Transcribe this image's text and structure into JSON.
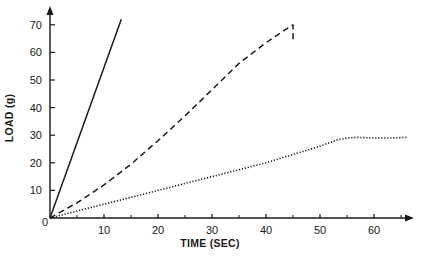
{
  "chart_data": {
    "type": "line",
    "title": "",
    "xlabel": "TIME (SEC)",
    "ylabel": "LOAD (g)",
    "xlim": [
      0,
      67
    ],
    "ylim": [
      0,
      73
    ],
    "x_ticks": [
      0,
      10,
      20,
      30,
      40,
      50,
      60
    ],
    "x_minor_ticks": [
      5,
      15,
      25,
      35,
      45,
      55,
      65
    ],
    "y_ticks": [
      0,
      10,
      20,
      30,
      40,
      50,
      60,
      70
    ],
    "grid": false,
    "legend": null,
    "series": [
      {
        "name": "solid",
        "style": "solid",
        "x": [
          0,
          13.2
        ],
        "y": [
          0,
          72
        ]
      },
      {
        "name": "dashed",
        "style": "dashed",
        "x": [
          0,
          5,
          10,
          15,
          20,
          25,
          30,
          35,
          40,
          43,
          45,
          45
        ],
        "y": [
          0,
          5.5,
          12,
          19.5,
          28,
          37,
          46.5,
          56,
          63.5,
          67.5,
          70,
          64
        ]
      },
      {
        "name": "dotted",
        "style": "dotted",
        "x": [
          0,
          5,
          10,
          15,
          20,
          25,
          30,
          35,
          40,
          45,
          50,
          53,
          55,
          57,
          60,
          63,
          66
        ],
        "y": [
          0,
          2.5,
          5,
          7.5,
          10,
          12.5,
          15,
          17.5,
          20,
          23,
          26,
          28.2,
          29,
          29.2,
          29,
          29,
          29.2
        ]
      }
    ]
  },
  "axes": {
    "x_title": "TIME (SEC)",
    "y_title": "LOAD (g)",
    "origin_label": "0"
  },
  "caption": {
    "text": ""
  }
}
